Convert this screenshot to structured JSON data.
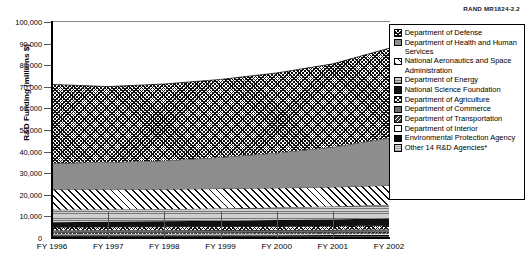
{
  "figure": {
    "source_id": "RAND MR1824-2.2"
  },
  "axes": {
    "ylabel": "R&D Funding (millions $)",
    "yticks": [
      "0",
      "10,000",
      "20,000",
      "30,000",
      "40,000",
      "50,000",
      "60,000",
      "70,000",
      "80,000",
      "90,000",
      "100,000"
    ],
    "xticks": [
      "FY 1996",
      "FY 1997",
      "FY 1998",
      "FY 1999",
      "FY 2000",
      "FY 2001",
      "FY 2002"
    ]
  },
  "legend": {
    "items": [
      {
        "label": "Department of Defense",
        "pattern": "p-dod"
      },
      {
        "label": "Department of Health and Human Services",
        "pattern": "p-hhs"
      },
      {
        "label": "National Aeronautics and Space Administration",
        "pattern": "p-nasa"
      },
      {
        "label": "Department of Energy",
        "pattern": "p-doe"
      },
      {
        "label": "National Science Foundation",
        "pattern": "p-nsf"
      },
      {
        "label": "Department of Agriculture",
        "pattern": "p-usda"
      },
      {
        "label": "Department of Commerce",
        "pattern": "p-doc"
      },
      {
        "label": "Department of Transportation",
        "pattern": "p-dot"
      },
      {
        "label": "Department of Interior",
        "pattern": "p-doi"
      },
      {
        "label": "Environmental Protection Agency",
        "pattern": "p-epa"
      },
      {
        "label": "Other 14 R&D Agencies*",
        "pattern": "p-other"
      }
    ]
  },
  "chart_data": {
    "type": "area",
    "stacked": true,
    "title": "",
    "xlabel": "",
    "ylabel": "R&D Funding (millions $)",
    "ylim": [
      0,
      100000
    ],
    "ytick_step": 10000,
    "grid": false,
    "legend_position": "right",
    "x": [
      "FY 1996",
      "FY 1997",
      "FY 1998",
      "FY 1999",
      "FY 2000",
      "FY 2001",
      "FY 2002"
    ],
    "stack_order_bottom_to_top": [
      "Other 14 R&D Agencies*",
      "Environmental Protection Agency",
      "Department of Interior",
      "Department of Transportation",
      "Department of Commerce",
      "Department of Agriculture",
      "National Science Foundation",
      "Department of Energy",
      "National Aeronautics and Space Administration",
      "Department of Health and Human Services",
      "Department of Defense"
    ],
    "series": [
      {
        "name": "Department of Defense",
        "values": [
          36500,
          35000,
          35500,
          36000,
          37000,
          38500,
          41500
        ]
      },
      {
        "name": "Department of Health and Human Services",
        "values": [
          12000,
          12500,
          13200,
          14500,
          16200,
          18500,
          22000
        ]
      },
      {
        "name": "National Aeronautics and Space Administration",
        "values": [
          9500,
          9400,
          9300,
          9200,
          9100,
          9000,
          9000
        ]
      },
      {
        "name": "Department of Energy",
        "values": [
          5800,
          5700,
          5600,
          5700,
          5800,
          6000,
          6200
        ]
      },
      {
        "name": "National Science Foundation",
        "values": [
          2300,
          2400,
          2500,
          2700,
          2900,
          3100,
          3400
        ]
      },
      {
        "name": "Department of Agriculture",
        "values": [
          1500,
          1550,
          1600,
          1650,
          1700,
          1750,
          1850
        ]
      },
      {
        "name": "Department of Commerce",
        "values": [
          1000,
          1020,
          1040,
          1060,
          1080,
          1100,
          1150
        ]
      },
      {
        "name": "Department of Transportation",
        "values": [
          650,
          660,
          670,
          680,
          690,
          700,
          720
        ]
      },
      {
        "name": "Department of Interior",
        "values": [
          580,
          585,
          590,
          595,
          600,
          610,
          620
        ]
      },
      {
        "name": "Environmental Protection Agency",
        "values": [
          570,
          575,
          580,
          585,
          590,
          600,
          610
        ]
      },
      {
        "name": "Other 14 R&D Agencies*",
        "values": [
          700,
          710,
          720,
          730,
          740,
          760,
          800
        ]
      }
    ],
    "totals": [
      71100,
      70100,
      71300,
      73400,
      76800,
      80600,
      87850
    ]
  }
}
